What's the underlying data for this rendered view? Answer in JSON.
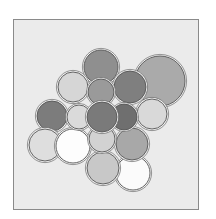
{
  "diagram": {
    "type": "overlapping-circles",
    "frame": {
      "x": 13,
      "y": 19,
      "width": 186,
      "height": 191,
      "fill": "#ebebeb",
      "stroke": "#8a8a8a"
    },
    "stroke_color": "#555555",
    "halo_color": "#f2f2f2",
    "circles": [
      {
        "id": "c-big-top-right",
        "cx": 160,
        "cy": 81,
        "r": 25,
        "fill": "#aaaaaa"
      },
      {
        "id": "c-top",
        "cx": 101,
        "cy": 67,
        "r": 17,
        "fill": "#8f8f8f"
      },
      {
        "id": "c-upper-left",
        "cx": 73,
        "cy": 87,
        "r": 15,
        "fill": "#d6d6d6"
      },
      {
        "id": "c-upper-right",
        "cx": 130,
        "cy": 87,
        "r": 16,
        "fill": "#7f7f7f"
      },
      {
        "id": "c-top-center",
        "cx": 101,
        "cy": 92,
        "r": 13,
        "fill": "#9a9a9a"
      },
      {
        "id": "c-right",
        "cx": 152,
        "cy": 114,
        "r": 15,
        "fill": "#d9d9d9"
      },
      {
        "id": "c-left",
        "cx": 52,
        "cy": 116,
        "r": 15,
        "fill": "#7c7c7c"
      },
      {
        "id": "c-bottom-left",
        "cx": 45,
        "cy": 145,
        "r": 16,
        "fill": "#dedede"
      },
      {
        "id": "c-bottom-right-white",
        "cx": 133,
        "cy": 173,
        "r": 17,
        "fill": "#fbfbfb"
      },
      {
        "id": "c-bottom",
        "cx": 103,
        "cy": 168,
        "r": 16,
        "fill": "#c8c8c8"
      },
      {
        "id": "c-right-bottom",
        "cx": 132,
        "cy": 144,
        "r": 16,
        "fill": "#a8a8a8"
      },
      {
        "id": "c-white-left",
        "cx": 73,
        "cy": 146,
        "r": 17,
        "fill": "#fdfdfd"
      },
      {
        "id": "c-center-bottom",
        "cx": 102,
        "cy": 139,
        "r": 13,
        "fill": "#d2d2d2"
      },
      {
        "id": "c-left-center",
        "cx": 79,
        "cy": 117,
        "r": 12,
        "fill": "#dadada"
      },
      {
        "id": "c-right-center",
        "cx": 124,
        "cy": 117,
        "r": 13,
        "fill": "#6f6f6f"
      },
      {
        "id": "c-center",
        "cx": 102,
        "cy": 117,
        "r": 15,
        "fill": "#7a7a7a"
      }
    ]
  }
}
